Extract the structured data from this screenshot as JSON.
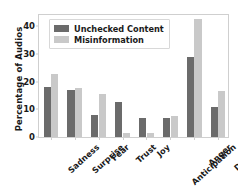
{
  "chart_data": {
    "type": "bar",
    "title": "",
    "xlabel": "",
    "ylabel": "Percentage of Audios",
    "ylim": [
      0,
      44
    ],
    "yticks": [
      0,
      10,
      20,
      30,
      40
    ],
    "grid": false,
    "legend_position": "upper-left",
    "categories": [
      "Sadness",
      "Surprise",
      "Fear",
      "Trust",
      "Joy",
      "Anticipation",
      "Anger",
      "Disgust"
    ],
    "series": [
      {
        "name": "Unchecked Content",
        "color": "#6b6b6b",
        "values": [
          18.0,
          16.9,
          7.8,
          12.8,
          6.8,
          6.9,
          28.8,
          10.8
        ]
      },
      {
        "name": "Misinformation",
        "color": "#c9c9c9",
        "values": [
          22.6,
          17.7,
          15.6,
          1.6,
          1.5,
          7.5,
          42.5,
          16.6
        ]
      }
    ]
  },
  "axis": {
    "ylabel": "Percentage of Audios"
  }
}
